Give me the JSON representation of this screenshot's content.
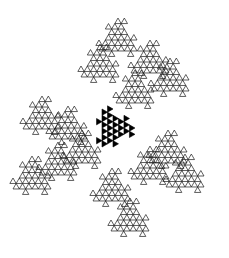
{
  "figure": {
    "type": "fractal-tiling",
    "background": "#ffffff",
    "stroke_color": "#1a1a1a",
    "fill_color": "#000000",
    "center_tile": {
      "cx": 113,
      "cy": 128,
      "scale": 19,
      "rotation": 0,
      "filled": true
    },
    "outline_tiles": [
      {
        "cx": 118,
        "cy": 40,
        "scale": 19,
        "rotation": 30
      },
      {
        "cx": 100,
        "cy": 66,
        "scale": 19,
        "rotation": 30
      },
      {
        "cx": 150,
        "cy": 62,
        "scale": 19,
        "rotation": 30
      },
      {
        "cx": 170,
        "cy": 80,
        "scale": 19,
        "rotation": 30
      },
      {
        "cx": 135,
        "cy": 92,
        "scale": 19,
        "rotation": 30
      },
      {
        "cx": 42,
        "cy": 118,
        "scale": 19,
        "rotation": 150
      },
      {
        "cx": 68,
        "cy": 128,
        "scale": 19,
        "rotation": 150
      },
      {
        "cx": 32,
        "cy": 178,
        "scale": 19,
        "rotation": 150
      },
      {
        "cx": 58,
        "cy": 164,
        "scale": 19,
        "rotation": 150
      },
      {
        "cx": 82,
        "cy": 152,
        "scale": 19,
        "rotation": 150
      },
      {
        "cx": 150,
        "cy": 168,
        "scale": 19,
        "rotation": 270
      },
      {
        "cx": 185,
        "cy": 176,
        "scale": 19,
        "rotation": 270
      },
      {
        "cx": 168,
        "cy": 152,
        "scale": 19,
        "rotation": 270
      },
      {
        "cx": 130,
        "cy": 220,
        "scale": 19,
        "rotation": 270
      },
      {
        "cx": 112,
        "cy": 190,
        "scale": 19,
        "rotation": 270
      }
    ],
    "recursion_depth": 3
  }
}
